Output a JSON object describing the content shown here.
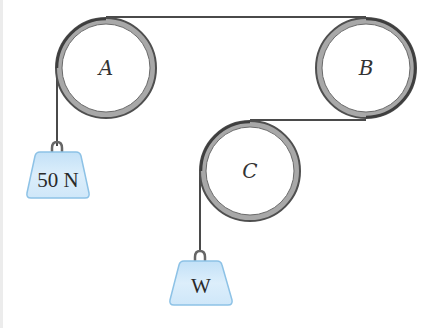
{
  "diagram": {
    "type": "pulley-system",
    "colors": {
      "background": "#ffffff",
      "rope": "#4a4a4a",
      "pulley_ring_fill": "#a8a8a8",
      "pulley_ring_stroke": "#555555",
      "pulley_inner": "#ffffff",
      "weight_fill": "#d4eafa",
      "weight_stroke": "#8dc2e6",
      "hook": "#666666"
    },
    "pulleys": [
      {
        "id": "A",
        "label": "A",
        "cx": 106,
        "cy": 68,
        "r": 51
      },
      {
        "id": "B",
        "label": "B",
        "cx": 366,
        "cy": 68,
        "r": 51
      },
      {
        "id": "C",
        "label": "C",
        "cx": 250,
        "cy": 171,
        "r": 51
      }
    ],
    "weights": [
      {
        "id": "left-weight",
        "label": "50 N"
      },
      {
        "id": "bottom-weight",
        "label": "W"
      }
    ],
    "rope_path": "50 N weight hangs from left side of A; rope passes over top of A to top of B, around right side of B, from bottom of B to top of C, down left side of C to weight W"
  }
}
